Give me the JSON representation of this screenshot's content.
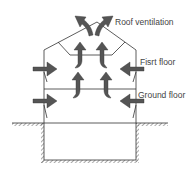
{
  "diagram": {
    "labels": {
      "roof": "Roof ventilation",
      "first_floor": "Fisrt floor",
      "ground_floor": "Ground floor"
    },
    "colors": {
      "arrow": "#555555",
      "line": "#333333",
      "text": "#444444"
    },
    "arrows": [
      {
        "id": "inlet-left-first",
        "direction": "right"
      },
      {
        "id": "inlet-right-first",
        "direction": "left"
      },
      {
        "id": "inlet-left-ground",
        "direction": "right"
      },
      {
        "id": "inlet-right-ground",
        "direction": "left"
      },
      {
        "id": "rise-ground-left",
        "direction": "up"
      },
      {
        "id": "rise-ground-right",
        "direction": "up"
      },
      {
        "id": "rise-first-left",
        "direction": "up"
      },
      {
        "id": "rise-first-right",
        "direction": "up"
      },
      {
        "id": "roof-outlet-left",
        "direction": "up-left"
      },
      {
        "id": "roof-outlet-right",
        "direction": "up-right"
      }
    ]
  }
}
